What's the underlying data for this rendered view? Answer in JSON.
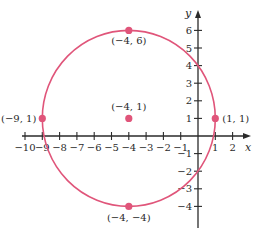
{
  "chart_data": {
    "type": "scatter",
    "title": "",
    "xlabel": "x",
    "ylabel": "y",
    "xlim": [
      -10.5,
      2.8
    ],
    "ylim": [
      -5,
      7
    ],
    "grid": false,
    "x_ticks": [
      -10,
      -9,
      -8,
      -7,
      -6,
      -5,
      -4,
      -3,
      -2,
      -1,
      1,
      2
    ],
    "x_tick_labels": [
      "−10",
      "−9",
      "−8",
      "−7",
      "−6",
      "−5",
      "−4",
      "−3",
      "−2",
      "−1",
      "1",
      "2"
    ],
    "y_ticks": [
      -4,
      -3,
      -2,
      -1,
      1,
      2,
      3,
      4,
      5,
      6
    ],
    "y_tick_labels": [
      "−4",
      "−3",
      "−2",
      "−1",
      "1",
      "2",
      "3",
      "4",
      "5",
      "6"
    ],
    "circle": {
      "center": [
        -4,
        1
      ],
      "radius": 5,
      "color": "#e0557a"
    },
    "points": [
      {
        "x": -4,
        "y": 6,
        "label": "(−4, 6)"
      },
      {
        "x": -4,
        "y": 1,
        "label": "(−4, 1)"
      },
      {
        "x": -9,
        "y": 1,
        "label": "(−9, 1)"
      },
      {
        "x": 1,
        "y": 1,
        "label": "(1, 1)"
      },
      {
        "x": -4,
        "y": -4,
        "label": "(−4, −4)"
      }
    ],
    "point_color": "#e0557a",
    "axis_color": "#2a2a2a"
  }
}
